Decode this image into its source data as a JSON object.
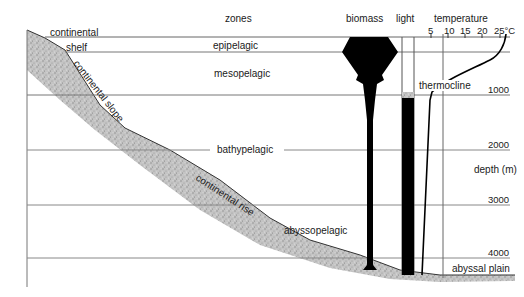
{
  "diagram": {
    "type": "ocean depth zones cross-section",
    "headers": {
      "zones": "zones",
      "biomass": "biomass",
      "light": "light",
      "temperature": "temperature"
    },
    "temperature_ticks": [
      "5",
      "10",
      "15",
      "20",
      "25°C"
    ],
    "zones": [
      "epipelagic",
      "mesopelagic",
      "bathypelagic",
      "abyssopelagic"
    ],
    "seafloor_features": {
      "shelf_top": "continental",
      "shelf_bottom": "shelf",
      "slope": "continental slope",
      "rise": "continental rise",
      "plain": "abyssal plain"
    },
    "annotations": {
      "thermocline": "thermocline"
    },
    "depth_axis": {
      "label": "depth (m)",
      "ticks": [
        "1000",
        "2000",
        "3000",
        "4000"
      ]
    },
    "colors": {
      "line": "#555555",
      "fill_dark": "#000000",
      "sediment": "#b8b8b8"
    }
  }
}
